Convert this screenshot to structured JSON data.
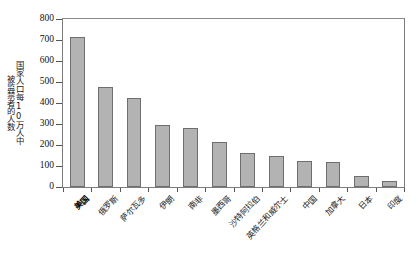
{
  "chart_data": {
    "type": "bar",
    "title": "",
    "xlabel": "",
    "ylabel_line1": "国家人口每10万人中",
    "ylabel_line2": "被监禁者的人数",
    "ylim": [
      0,
      800
    ],
    "ytick_values": [
      0,
      100,
      200,
      300,
      400,
      500,
      600,
      700,
      800
    ],
    "ytick_labels": [
      "0",
      "100",
      "200",
      "300",
      "400",
      "500",
      "600",
      "700",
      "800"
    ],
    "grid": false,
    "legend": null,
    "bar_color": "#b3b3b3",
    "bar_edge_color": "#6e6e6e",
    "categories": [
      "美国",
      "俄罗斯",
      "萨尔瓦多",
      "伊朗",
      "南非",
      "墨西哥",
      "沙特阿拉伯",
      "英格兰和威尔士",
      "中国",
      "加拿大",
      "日本",
      "印度"
    ],
    "values": [
      715,
      475,
      422,
      295,
      283,
      212,
      162,
      148,
      125,
      119,
      54,
      30
    ]
  }
}
